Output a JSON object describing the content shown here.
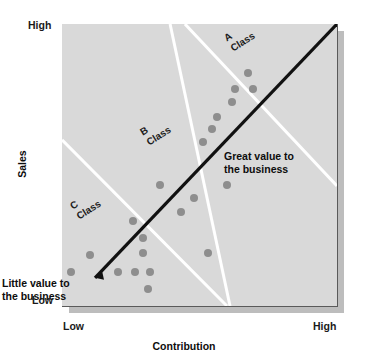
{
  "chart_data": {
    "type": "scatter",
    "title": "",
    "xlabel": "Contribution",
    "ylabel": "Sales",
    "x_tick_labels": [
      "Low",
      "High"
    ],
    "y_tick_labels": [
      "Low",
      "High"
    ],
    "xlim": [
      0,
      100
    ],
    "ylim": [
      0,
      100
    ],
    "grid": false,
    "legend": "none",
    "plot_background": "#d9d9d9",
    "point_color": "#8e8e8e",
    "band_line_color": "#ffffff",
    "trend_arrow_color": "#111111",
    "points": [
      {
        "x": 67.5,
        "y": 82.5
      },
      {
        "x": 62.8,
        "y": 77.0
      },
      {
        "x": 69.3,
        "y": 77.0
      },
      {
        "x": 61.7,
        "y": 72.3
      },
      {
        "x": 56.2,
        "y": 67.1
      },
      {
        "x": 54.4,
        "y": 62.6
      },
      {
        "x": 51.1,
        "y": 58.2
      },
      {
        "x": 35.6,
        "y": 42.9
      },
      {
        "x": 60.0,
        "y": 42.9
      },
      {
        "x": 48.0,
        "y": 38.3
      },
      {
        "x": 43.3,
        "y": 33.3
      },
      {
        "x": 25.8,
        "y": 30.1
      },
      {
        "x": 29.5,
        "y": 24.1
      },
      {
        "x": 29.5,
        "y": 18.8
      },
      {
        "x": 53.1,
        "y": 18.8
      },
      {
        "x": 10.2,
        "y": 18.1
      },
      {
        "x": 3.3,
        "y": 12.1
      },
      {
        "x": 20.4,
        "y": 12.1
      },
      {
        "x": 26.5,
        "y": 12.1
      },
      {
        "x": 32.0,
        "y": 12.1
      },
      {
        "x": 31.3,
        "y": 6.0
      }
    ],
    "band_lines": [
      {
        "name": "A-B boundary",
        "x1": 44.7,
        "y1": 100,
        "x2": 100,
        "y2": 42.6
      },
      {
        "name": "B-C boundary",
        "x1": 0,
        "y1": 58.9,
        "x2": 60.0,
        "y2": 0
      },
      {
        "name": "C-lower boundary",
        "x1": 39.3,
        "y1": 100,
        "x2": 61.1,
        "y2": 0
      }
    ],
    "trend_arrow": {
      "x1": 12.0,
      "y1": 10.0,
      "x2": 100,
      "y2": 100
    },
    "annotations": [
      {
        "name": "class-a",
        "text_lines": [
          "A",
          "Class"
        ],
        "rotation_deg": -32
      },
      {
        "name": "class-b",
        "text_lines": [
          "B",
          "Class"
        ],
        "rotation_deg": -32
      },
      {
        "name": "class-c",
        "text_lines": [
          "C",
          "Class"
        ],
        "rotation_deg": -32
      },
      {
        "name": "great-value",
        "text_lines": [
          "Great value to",
          "the business"
        ]
      },
      {
        "name": "little-value",
        "text_lines": [
          "Little value to",
          "the business"
        ]
      }
    ]
  },
  "axes": {
    "y_title": "Sales",
    "x_title": "Contribution",
    "y_high": "High",
    "y_low": "Low",
    "x_low": "Low",
    "x_high": "High"
  },
  "classes": {
    "a_line1": "A",
    "a_line2": "Class",
    "b_line1": "B",
    "b_line2": "Class",
    "c_line1": "C",
    "c_line2": "Class"
  },
  "callouts": {
    "great_line1": "Great value to",
    "great_line2": "the business",
    "little_line1": "Little value to",
    "little_line2": "the business"
  },
  "colors": {
    "panel": "#d9d9d9",
    "point": "#8e8e8e",
    "band": "#ffffff",
    "arrow": "#111111",
    "text": "#0d0d0d"
  }
}
